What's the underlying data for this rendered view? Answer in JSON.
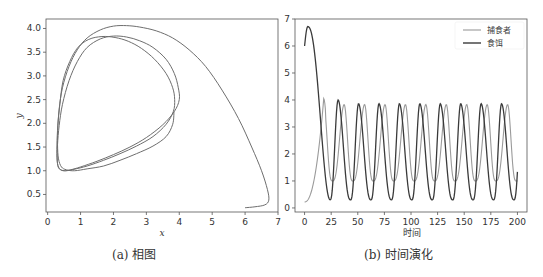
{
  "chart_data": [
    {
      "type": "line",
      "title": "",
      "caption": "(a) 相图",
      "xlabel": "x",
      "ylabel": "y",
      "xlim": [
        -0.05,
        7.0
      ],
      "ylim": [
        0.13,
        4.2
      ],
      "xticks": [
        0,
        1,
        2,
        3,
        4,
        5,
        6,
        7
      ],
      "yticks": [
        0.5,
        1.0,
        1.5,
        2.0,
        2.5,
        3.0,
        3.5,
        4.0
      ],
      "ytick_labels": [
        "0.5",
        "1.0",
        "1.5",
        "2.0",
        "2.5",
        "3.0",
        "3.5",
        "4.0"
      ],
      "grid": false,
      "series": [
        {
          "name": "trajectory",
          "color": "#6e6e6e",
          "x": [
            6.0,
            6.3,
            6.6,
            6.72,
            6.68,
            6.5,
            6.2,
            5.8,
            5.3,
            4.8,
            4.3,
            3.8,
            3.3,
            2.8,
            2.4,
            2.0,
            1.6,
            1.2,
            0.9,
            0.65,
            0.45,
            0.35,
            0.3,
            0.28,
            0.3,
            0.38,
            0.5,
            0.7,
            1.0,
            1.5,
            2.0,
            2.5,
            3.0,
            3.5,
            3.85,
            4.0,
            3.97,
            3.85,
            3.6,
            3.2,
            2.8,
            2.4,
            2.0,
            1.6,
            1.2,
            0.9,
            0.65,
            0.45,
            0.35,
            0.3,
            0.29,
            0.32,
            0.4,
            0.55,
            0.8,
            1.2,
            1.7,
            2.2,
            2.7,
            3.2,
            3.6,
            3.82,
            3.86,
            3.8,
            3.6,
            3.25,
            2.85,
            2.45,
            2.05,
            1.65,
            1.25,
            0.92,
            0.67,
            0.47,
            0.37,
            0.31,
            0.3,
            0.33,
            0.42,
            0.57,
            0.82,
            1.2,
            1.7,
            2.2,
            2.7,
            3.2,
            3.6,
            3.8,
            3.84
          ],
          "y": [
            0.22,
            0.24,
            0.28,
            0.38,
            0.6,
            1.0,
            1.5,
            2.1,
            2.7,
            3.2,
            3.55,
            3.8,
            3.95,
            4.03,
            4.06,
            4.05,
            3.97,
            3.8,
            3.55,
            3.2,
            2.75,
            2.3,
            1.85,
            1.45,
            1.15,
            1.03,
            1.0,
            1.02,
            1.08,
            1.2,
            1.34,
            1.5,
            1.7,
            1.97,
            2.25,
            2.5,
            2.75,
            3.05,
            3.35,
            3.6,
            3.74,
            3.82,
            3.84,
            3.78,
            3.6,
            3.3,
            2.9,
            2.4,
            1.95,
            1.55,
            1.25,
            1.08,
            1.02,
            1.0,
            1.03,
            1.1,
            1.22,
            1.36,
            1.52,
            1.72,
            1.98,
            2.25,
            2.5,
            2.75,
            3.05,
            3.35,
            3.58,
            3.73,
            3.81,
            3.83,
            3.77,
            3.6,
            3.3,
            2.9,
            2.4,
            1.95,
            1.55,
            1.25,
            1.08,
            1.02,
            1.0,
            1.04,
            1.1,
            1.22,
            1.36,
            1.52,
            1.72,
            1.98,
            2.25
          ]
        }
      ]
    },
    {
      "type": "line",
      "title": "",
      "caption": "(b) 时间演化",
      "xlabel": "时间",
      "ylabel": "",
      "xlim": [
        -9,
        209
      ],
      "ylim": [
        -0.15,
        7.0
      ],
      "xticks": [
        0,
        25,
        50,
        75,
        100,
        125,
        150,
        175,
        200
      ],
      "yticks": [
        0,
        1,
        2,
        3,
        4,
        5,
        6,
        7
      ],
      "grid": false,
      "legend_position": "upper right",
      "series": [
        {
          "name": "捕食者",
          "color": "#9a9a9a",
          "period": 19.2,
          "first_peak_t": 18,
          "first_peak_value": 4.05,
          "peak_times": [
            18,
            36.5,
            55.5,
            74.5,
            93.5,
            113,
            132,
            151,
            170,
            189
          ],
          "peak_value": 3.83,
          "trough_value": 1.0,
          "start": [
            0,
            0.22
          ],
          "end": [
            200,
            1.05
          ]
        },
        {
          "name": "食饵",
          "color": "#3a3a3a",
          "period": 19.2,
          "start": [
            0,
            6.0
          ],
          "max_initial": [
            3,
            6.72
          ],
          "peak_times": [
            31.5,
            51,
            70,
            89,
            108,
            127.5,
            146.5,
            165.5,
            185
          ],
          "first_peak_value": 4.0,
          "peak_value": 3.86,
          "trough_value": 0.3,
          "trough_times": [
            24,
            42.5,
            61.5,
            81,
            100,
            119,
            138,
            157.5,
            176.5,
            195.5
          ],
          "end": [
            200,
            1.28
          ]
        }
      ]
    }
  ],
  "left_plot": {
    "caption": "(a) 相图",
    "xlabel": "x",
    "ylabel": "y"
  },
  "right_plot": {
    "caption": "(b) 时间演化",
    "xlabel": "时间",
    "legend": [
      "捕食者",
      "食饵"
    ]
  }
}
